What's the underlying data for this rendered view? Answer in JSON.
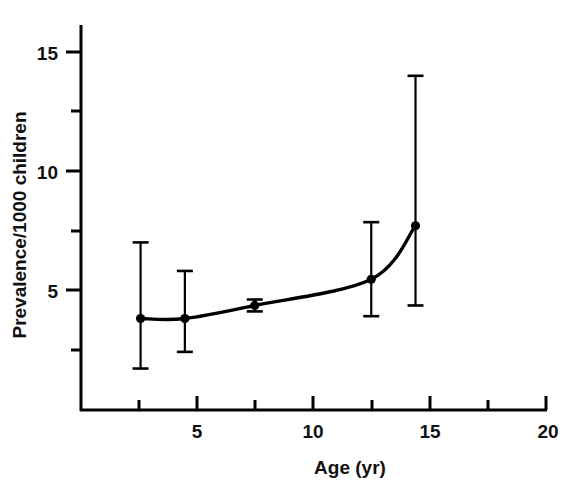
{
  "chart_data": {
    "type": "line",
    "title": "",
    "subtitle": "",
    "xlabel": "Age (yr)",
    "ylabel": "Prevalence/1000 children",
    "xlim": [
      0,
      20
    ],
    "ylim": [
      0,
      16.8
    ],
    "grid": false,
    "legend": "none",
    "x_ticks_major": [
      5,
      10,
      15,
      20
    ],
    "x_tick_labels": [
      "5",
      "10",
      "15",
      "20"
    ],
    "x_ticks_minor": [
      2.5,
      7.5,
      12.5,
      17.5
    ],
    "y_ticks_major": [
      5,
      10,
      15
    ],
    "y_tick_labels": [
      "5",
      "10",
      "15"
    ],
    "y_ticks_minor": [
      2.5,
      7.5,
      12.5
    ],
    "x": [
      2.6,
      4.5,
      7.5,
      12.5,
      14.4
    ],
    "values": [
      3.8,
      3.8,
      4.35,
      5.45,
      7.7
    ],
    "error_low": [
      1.7,
      2.4,
      4.1,
      3.9,
      4.35
    ],
    "error_high": [
      7.0,
      5.8,
      4.6,
      7.85,
      14.0
    ],
    "series": [
      {
        "name": "Prevalence",
        "x": [
          2.6,
          4.5,
          7.5,
          12.5,
          14.4
        ],
        "values": [
          3.8,
          3.8,
          4.35,
          5.45,
          7.7
        ],
        "error_low": [
          1.7,
          2.4,
          4.1,
          3.9,
          4.35
        ],
        "error_high": [
          7.0,
          5.8,
          4.6,
          7.85,
          14.0
        ],
        "marker": "filled-circle",
        "color": "#000000"
      }
    ]
  },
  "axes": {
    "x_axis_title": "Age (yr)",
    "y_axis_title": "Prevalence/1000 children",
    "x_labels": [
      "5",
      "10",
      "15",
      "20"
    ],
    "y_labels": [
      "15",
      "10",
      "5"
    ]
  },
  "colors": {
    "line": "#000000",
    "marker": "#000000",
    "error_bar": "#000000",
    "axis": "#000000",
    "background": "#ffffff"
  }
}
